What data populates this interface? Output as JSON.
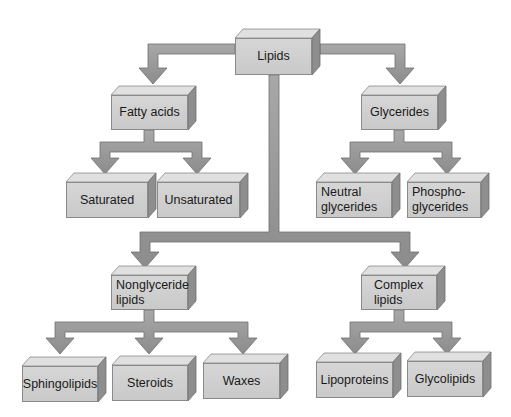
{
  "diagram": {
    "colors": {
      "box_face": "#cfcfcf",
      "box_top": "#e2e2e2",
      "box_side": "#8e8e8e",
      "arrow": "#9a9a9a",
      "arrow_edge": "#6e6e6e"
    },
    "nodes": {
      "lipids": {
        "label": "Lipids"
      },
      "fatty_acids": {
        "label": "Fatty acids"
      },
      "glycerides": {
        "label": "Glycerides"
      },
      "saturated": {
        "label": "Saturated"
      },
      "unsaturated": {
        "label": "Unsaturated"
      },
      "neutral_glycerides": {
        "line1": "Neutral",
        "line2": "glycerides"
      },
      "phosphoglycerides": {
        "line1": "Phospho-",
        "line2": "glycerides"
      },
      "nonglyceride_lipids": {
        "line1": "Nonglyceride",
        "line2": "lipids"
      },
      "complex_lipids": {
        "line1": "Complex",
        "line2": "lipids"
      },
      "sphingolipids": {
        "label": "Sphingolipids"
      },
      "steroids": {
        "label": "Steroids"
      },
      "waxes": {
        "label": "Waxes"
      },
      "lipoproteins": {
        "label": "Lipoproteins"
      },
      "glycolipids": {
        "label": "Glycolipids"
      }
    },
    "edges": [
      [
        "Lipids",
        "Fatty acids"
      ],
      [
        "Lipids",
        "Glycerides"
      ],
      [
        "Lipids",
        "Nonglyceride lipids"
      ],
      [
        "Lipids",
        "Complex lipids"
      ],
      [
        "Fatty acids",
        "Saturated"
      ],
      [
        "Fatty acids",
        "Unsaturated"
      ],
      [
        "Glycerides",
        "Neutral glycerides"
      ],
      [
        "Glycerides",
        "Phosphoglycerides"
      ],
      [
        "Nonglyceride lipids",
        "Sphingolipids"
      ],
      [
        "Nonglyceride lipids",
        "Steroids"
      ],
      [
        "Nonglyceride lipids",
        "Waxes"
      ],
      [
        "Complex lipids",
        "Lipoproteins"
      ],
      [
        "Complex lipids",
        "Glycolipids"
      ]
    ]
  }
}
